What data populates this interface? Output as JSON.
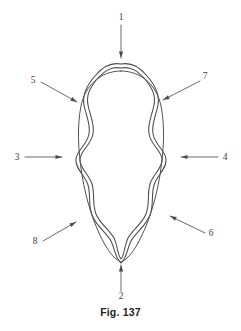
{
  "figure": {
    "caption": "Fig. 137",
    "stroke_color": "#4a4a4a",
    "inner_stroke_color": "#525252",
    "leader_color": "#5a5a5a",
    "background_color": "#ffffff",
    "label_color": "#3d3d3d"
  },
  "callouts": [
    {
      "id": "1",
      "label": "1",
      "name": "callout-1",
      "position": "top",
      "arrow_direction": "down",
      "label_x": 121,
      "label_y": 20,
      "line_x1": 121,
      "line_y1": 25,
      "line_x2": 121,
      "line_y2": 58
    },
    {
      "id": "2",
      "label": "2",
      "name": "callout-2",
      "position": "bottom",
      "arrow_direction": "up",
      "label_x": 121,
      "label_y": 299,
      "line_x1": 121,
      "line_y1": 291,
      "line_x2": 121,
      "line_y2": 265
    },
    {
      "id": "3",
      "label": "3",
      "name": "callout-3",
      "position": "left-middle",
      "arrow_direction": "right",
      "label_x": 17,
      "label_y": 160,
      "line_x1": 25,
      "line_y1": 157,
      "line_x2": 62,
      "line_y2": 157
    },
    {
      "id": "4",
      "label": "4",
      "name": "callout-4",
      "position": "right-middle",
      "arrow_direction": "left",
      "label_x": 225,
      "label_y": 160,
      "line_x1": 218,
      "line_y1": 157,
      "line_x2": 181,
      "line_y2": 157
    },
    {
      "id": "5",
      "label": "5",
      "name": "callout-5",
      "position": "upper-left",
      "arrow_direction": "down-right",
      "label_x": 33,
      "label_y": 83,
      "line_x1": 41,
      "line_y1": 82,
      "line_x2": 77,
      "line_y2": 102
    },
    {
      "id": "6",
      "label": "6",
      "name": "callout-6",
      "position": "lower-right",
      "arrow_direction": "up-left",
      "label_x": 211,
      "label_y": 236,
      "line_x1": 205,
      "line_y1": 233,
      "line_x2": 170,
      "line_y2": 216
    },
    {
      "id": "7",
      "label": "7",
      "name": "callout-7",
      "position": "upper-right",
      "arrow_direction": "down-left",
      "label_x": 205,
      "label_y": 79,
      "line_x1": 200,
      "line_y1": 81,
      "line_x2": 163,
      "line_y2": 100
    },
    {
      "id": "8",
      "label": "8",
      "name": "callout-8",
      "position": "lower-left",
      "arrow_direction": "up-right",
      "label_x": 35,
      "label_y": 244,
      "line_x1": 43,
      "line_y1": 241,
      "line_x2": 76,
      "line_y2": 222
    }
  ],
  "geometry": {
    "outer_band_outer_path": "M 121 64 C 133 62 140 68 147 76 C 155 85 160 94 158 105 C 156 116 151 124 153 134 C 155 145 165 150 166 159 C 167 169 157 175 154 185 C 151 195 154 205 150 215 C 146 226 136 232 131 241 C 127 249 127 258 121 263 C 115 258 115 249 111 241 C 106 232 96 226 92 215 C 88 205 91 195 88 185 C 85 175 75 169 76 159 C 77 150 87 145 89 134 C 91 124 86 116 84 105 C 82 94 87 85 95 76 C 102 68 109 62 121 64 Z",
    "outer_band_inner_path": "M 121 68 C 132 66 138 72 145 79 C 152 88 156 95 154 105 C 152 116 147 124 149 134 C 151 145 161 150 162 159 C 163 168 153 174 150 184 C 147 194 150 204 146 214 C 142 224 133 229 128 238 C 124 246 125 254 121 259 C 117 254 118 246 114 238 C 109 229 100 224 96 214 C 92 204 95 194 92 184 C 89 174 79 168 80 159 C 81 150 91 145 93 134 C 95 124 90 116 88 105 C 86 95 90 88 97 79 C 104 72 110 66 121 68 Z",
    "inner_oval_path": "M 121 71 C 142 71 157 86 161 106 C 165 126 164 150 160 175 C 156 200 148 225 138 243 C 132 254 126 260 121 262 C 116 260 110 254 104 243 C 94 225 86 200 82 175 C 78 150 77 126 81 106 C 85 86 100 71 121 71 Z"
  }
}
